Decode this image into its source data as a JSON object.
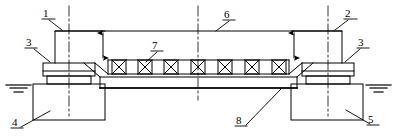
{
  "drawing": {
    "title": "Bridge girder on piers — longitudinal elevation",
    "type": "engineering-elevation-drawing",
    "line_color": "#000000",
    "background_color": "#ffffff",
    "width": 397,
    "height": 140
  },
  "callouts": [
    {
      "id": "1",
      "label": "1",
      "x": 46,
      "y": 10,
      "target": "left-upper-deck-slab"
    },
    {
      "id": "2",
      "label": "2",
      "x": 347,
      "y": 10,
      "target": "right-upper-deck-slab"
    },
    {
      "id": "3L",
      "label": "3",
      "x": 28,
      "y": 41,
      "target": "left-bearing-pad"
    },
    {
      "id": "3R",
      "label": "3",
      "x": 361,
      "y": 41,
      "target": "right-bearing-pad"
    },
    {
      "id": "4",
      "label": "4",
      "x": 13,
      "y": 122,
      "target": "left-pier-foundation"
    },
    {
      "id": "5",
      "label": "5",
      "x": 372,
      "y": 120,
      "target": "right-pier-foundation"
    },
    {
      "id": "6",
      "label": "6",
      "x": 227,
      "y": 11,
      "target": "top-chord-deck"
    },
    {
      "id": "7",
      "label": "7",
      "x": 156,
      "y": 44,
      "target": "x-brace-web-member"
    },
    {
      "id": "8",
      "label": "8",
      "x": 239,
      "y": 118,
      "target": "bottom-chord-girder"
    }
  ],
  "structure": {
    "truss": {
      "brace_count": 7,
      "brace_symbol": "x-brace"
    },
    "piers": 2,
    "bearings": 2,
    "water_level_symbols": 2,
    "dimension_arrows": 2,
    "centerlines": 4
  }
}
